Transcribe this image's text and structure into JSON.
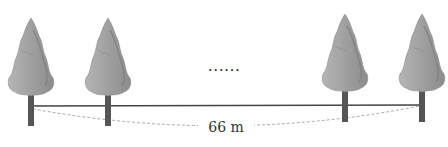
{
  "diagram": {
    "distance_label": "66 m",
    "ellipsis": "......",
    "trees": [
      {
        "name": "tree-1",
        "x": 31
      },
      {
        "name": "tree-2",
        "x": 108
      },
      {
        "name": "tree-3",
        "x": 345
      },
      {
        "name": "tree-4",
        "x": 422
      }
    ],
    "colors": {
      "foliage_light": "#c8c8c8",
      "foliage_dark": "#8a8a8a",
      "trunk": "#555555",
      "ground": "#444444",
      "dashed": "#aaaaaa"
    }
  }
}
